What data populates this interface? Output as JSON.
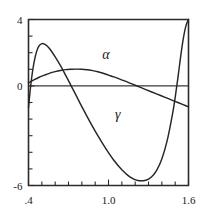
{
  "chart_data": {
    "type": "line",
    "title": "",
    "xlabel": "",
    "ylabel": "",
    "xlim": [
      0.4,
      1.6
    ],
    "ylim": [
      -6,
      4
    ],
    "grid": false,
    "legend_position": "inline-annotation",
    "x_tick_labels": [
      ".4",
      "1.0",
      "1.6"
    ],
    "x_tick_values": [
      0.4,
      1.0,
      1.6
    ],
    "x_minor_tick_step": 0.1,
    "y_tick_labels": [
      "4",
      "0",
      "-6"
    ],
    "y_tick_values": [
      4,
      0,
      -6
    ],
    "y_minor_tick_step": 1,
    "zero_reference_line": true,
    "annotations": [
      {
        "text": "α",
        "name": "alpha",
        "x": 0.98,
        "y": 1.6
      },
      {
        "text": "γ",
        "name": "gamma",
        "x": 1.07,
        "y": -2.0
      }
    ],
    "series": [
      {
        "name": "alpha",
        "label": "α",
        "color": "#262626",
        "x": [
          0.4,
          0.44,
          0.48,
          0.52,
          0.56,
          0.6,
          0.64,
          0.68,
          0.72,
          0.76,
          0.8,
          0.84,
          0.88,
          0.92,
          0.96,
          1.0,
          1.04,
          1.08,
          1.12,
          1.16,
          1.2,
          1.24,
          1.28,
          1.32,
          1.36,
          1.4,
          1.44,
          1.48,
          1.52,
          1.56,
          1.6
        ],
        "y": [
          0.18,
          0.36,
          0.52,
          0.65,
          0.77,
          0.86,
          0.93,
          0.98,
          1.0,
          1.01,
          1.0,
          0.97,
          0.92,
          0.85,
          0.76,
          0.65,
          0.54,
          0.42,
          0.3,
          0.17,
          0.04,
          -0.09,
          -0.22,
          -0.35,
          -0.48,
          -0.61,
          -0.74,
          -0.87,
          -1.0,
          -1.13,
          -1.26
        ]
      },
      {
        "name": "gamma",
        "label": "γ",
        "color": "#262626",
        "x": [
          0.4,
          0.42,
          0.44,
          0.46,
          0.48,
          0.5,
          0.52,
          0.54,
          0.56,
          0.6,
          0.64,
          0.68,
          0.72,
          0.76,
          0.8,
          0.86,
          0.92,
          0.98,
          1.04,
          1.1,
          1.16,
          1.22,
          1.28,
          1.32,
          1.36,
          1.4,
          1.44,
          1.48,
          1.5,
          1.52,
          1.54,
          1.56,
          1.58,
          1.6
        ],
        "y": [
          -1.3,
          0.25,
          1.35,
          2.05,
          2.42,
          2.55,
          2.52,
          2.4,
          2.22,
          1.75,
          1.22,
          0.62,
          0.0,
          -0.62,
          -1.25,
          -2.15,
          -3.0,
          -3.78,
          -4.48,
          -5.05,
          -5.48,
          -5.7,
          -5.68,
          -5.5,
          -5.1,
          -4.4,
          -3.3,
          -1.7,
          -0.7,
          0.45,
          1.7,
          2.8,
          3.6,
          4.0
        ]
      }
    ]
  }
}
